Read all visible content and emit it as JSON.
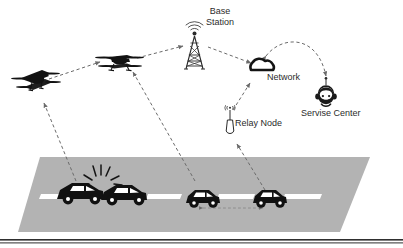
{
  "diagram": {
    "nodes": {
      "base_station": {
        "label": "Base\nStation",
        "icon": "cell-tower-icon"
      },
      "network": {
        "label": "Network",
        "icon": "cloud-icon"
      },
      "relay_node": {
        "label": "Relay Node",
        "icon": "relay-antenna-icon"
      },
      "service_center": {
        "label": "Servise Center",
        "icon": "headset-operator-icon"
      },
      "drone_left": {
        "label": "",
        "icon": "quadcopter-drone-icon"
      },
      "drone_right": {
        "label": "",
        "icon": "quadcopter-drone-icon"
      }
    },
    "road": {
      "surface_color": "#b3b3b3",
      "lane_marking_color": "#ffffff",
      "lane_marking_count": 4,
      "vehicles": [
        {
          "name": "crashed-car-rear",
          "state": "collision"
        },
        {
          "name": "crashed-car-front",
          "state": "collision"
        },
        {
          "name": "car-three",
          "state": "normal"
        },
        {
          "name": "car-four",
          "state": "normal"
        }
      ],
      "collision_marker": "impact-burst-icon"
    },
    "links": [
      {
        "name": "crash-to-drone-left",
        "style": "dashed-arrow"
      },
      {
        "name": "drone-left-to-drone-right",
        "style": "dashed-arrow"
      },
      {
        "name": "car-three-to-drone-right",
        "style": "dashed-arrow"
      },
      {
        "name": "drone-right-to-base-station",
        "style": "dashed-arrow"
      },
      {
        "name": "base-station-to-network",
        "style": "dashed-arrow"
      },
      {
        "name": "relay-node-to-network",
        "style": "dashed-arrow"
      },
      {
        "name": "car-four-to-relay-node",
        "style": "dashed-arrow"
      },
      {
        "name": "network-to-service-center",
        "style": "dashed-curved-arrow"
      },
      {
        "name": "car-three-to-car-four-v2v",
        "style": "dashed-double-arrow"
      }
    ],
    "colors": {
      "ink": "#1a1a1a",
      "text": "#2b2b2b",
      "road": "#b3b3b3",
      "link": "#6b6b6b",
      "baseline_rule": "#2f2f2f"
    }
  }
}
